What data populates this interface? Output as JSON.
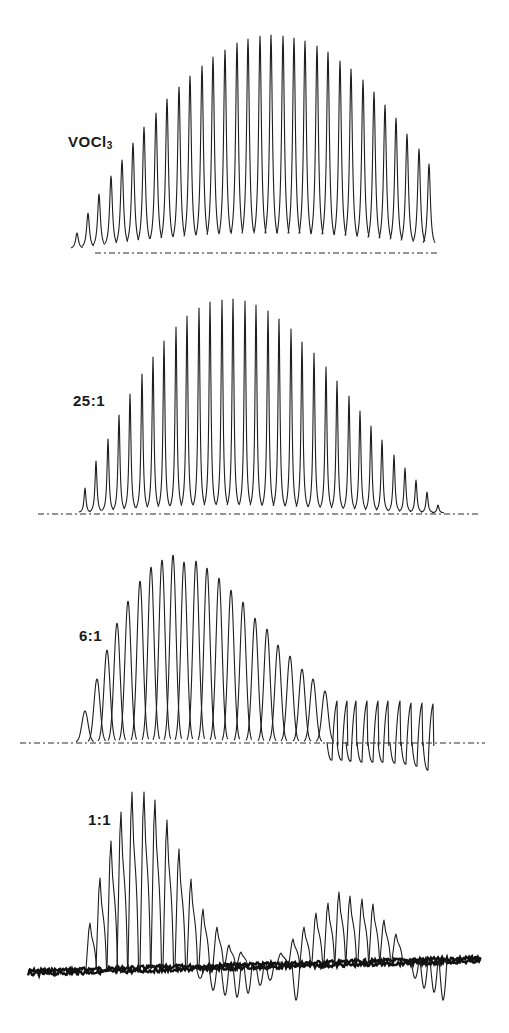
{
  "figure": {
    "panels": [
      {
        "id": "voclc3",
        "label_main": "VOCl",
        "label_sub": "3",
        "label_pos": [
          68,
          134
        ]
      },
      {
        "id": "ratio-25",
        "label_main": "25:1",
        "label_sub": "",
        "label_pos": [
          73,
          393
        ]
      },
      {
        "id": "ratio-6",
        "label_main": "6:1",
        "label_sub": "",
        "label_pos": [
          79,
          628
        ]
      },
      {
        "id": "ratio-1",
        "label_main": "1:1",
        "label_sub": "",
        "label_pos": [
          88,
          812
        ]
      }
    ]
  },
  "chart_data": [
    {
      "type": "line",
      "title": "VOCl3",
      "description": "Stacked series of sharp peaks (spectrum trace), envelope rising then falling",
      "xlabel": "",
      "ylabel": "",
      "grid": false,
      "baseline_y": 249,
      "dashed_baseline": {
        "x0": 95,
        "x1": 440,
        "y": 253
      },
      "peak_width": 4.2,
      "peaks_x": [
        77,
        88,
        99,
        111,
        122,
        133,
        144,
        156,
        167,
        179,
        190,
        202,
        213,
        225,
        237,
        248,
        260,
        271,
        283,
        294,
        305,
        317,
        328,
        340,
        351,
        363,
        374,
        385,
        396,
        407,
        419,
        429
      ],
      "peaks_top_y": [
        233,
        213,
        194,
        176,
        160,
        143,
        127,
        113,
        99,
        87,
        76,
        66,
        57,
        50,
        43,
        39,
        36,
        35,
        36,
        38,
        41,
        46,
        52,
        61,
        69,
        80,
        92,
        105,
        118,
        134,
        149,
        164
      ],
      "relative_heights": [
        0.07,
        0.17,
        0.26,
        0.34,
        0.42,
        0.5,
        0.57,
        0.64,
        0.71,
        0.76,
        0.81,
        0.86,
        0.9,
        0.93,
        0.97,
        0.98,
        1.0,
        1.0,
        1.0,
        0.99,
        0.97,
        0.95,
        0.92,
        0.87,
        0.84,
        0.79,
        0.73,
        0.67,
        0.61,
        0.53,
        0.47,
        0.4
      ]
    },
    {
      "type": "line",
      "title": "25:1",
      "description": "Sharp peaks, envelope peaking toward center then tapering",
      "xlabel": "",
      "ylabel": "",
      "grid": false,
      "baseline_y": 513,
      "dashed_baseline": {
        "x0": 38,
        "x1": 478,
        "y": 514
      },
      "peak_width": 3.6,
      "peaks_x": [
        85,
        96,
        108,
        119,
        130,
        142,
        153,
        164,
        176,
        187,
        199,
        210,
        222,
        233,
        245,
        256,
        268,
        279,
        291,
        302,
        314,
        326,
        337,
        349,
        360,
        371,
        382,
        394,
        405,
        416,
        427,
        438
      ],
      "peaks_top_y": [
        488,
        461,
        439,
        415,
        394,
        374,
        357,
        341,
        327,
        316,
        308,
        302,
        300,
        299,
        301,
        305,
        311,
        319,
        329,
        342,
        353,
        367,
        381,
        396,
        411,
        426,
        440,
        455,
        468,
        480,
        492,
        505
      ],
      "relative_heights": [
        0.12,
        0.24,
        0.34,
        0.46,
        0.56,
        0.65,
        0.73,
        0.8,
        0.87,
        0.92,
        0.95,
        0.98,
        0.99,
        1.0,
        0.99,
        0.97,
        0.95,
        0.91,
        0.86,
        0.8,
        0.75,
        0.68,
        0.62,
        0.55,
        0.48,
        0.41,
        0.34,
        0.27,
        0.21,
        0.15,
        0.1,
        0.04
      ]
    },
    {
      "type": "line",
      "title": "6:1",
      "description": "Broader peaks with maximum near left; right portion shows dispersive (sawtooth) lines going below baseline",
      "xlabel": "",
      "ylabel": "",
      "grid": false,
      "baseline_y": 742,
      "dashed_baseline": {
        "x0": 20,
        "x1": 485,
        "y": 743
      },
      "peak_width": 6.5,
      "peaks_x": [
        85,
        97,
        107,
        117,
        128,
        140,
        151,
        162,
        173,
        184,
        196,
        207,
        219,
        231,
        243,
        255,
        267,
        278,
        290,
        302,
        313,
        325
      ],
      "peaks_top_y": [
        711,
        679,
        650,
        623,
        601,
        581,
        567,
        560,
        555,
        562,
        561,
        568,
        578,
        590,
        602,
        618,
        629,
        645,
        656,
        669,
        679,
        691
      ],
      "dispersive_x": [
        337,
        347,
        356,
        367,
        378,
        388,
        400,
        411,
        422,
        433
      ],
      "dispersive_top_y": [
        701,
        701,
        701,
        701,
        701,
        701,
        701,
        703,
        703,
        704
      ],
      "dispersive_trough_y": [
        760,
        760,
        761,
        762,
        762,
        762,
        763,
        764,
        766,
        770
      ]
    },
    {
      "type": "line",
      "title": "1:1",
      "description": "Noisy trace with two peak groups: strong left group and weaker right group; negative excursions below baseline",
      "xlabel": "",
      "ylabel": "",
      "grid": false,
      "baseline": {
        "x0": 28,
        "y0": 971,
        "x1": 481,
        "y1": 958
      },
      "group1_x": [
        90,
        100,
        111,
        121,
        132,
        144,
        155,
        167,
        179,
        191,
        203,
        217,
        229,
        241
      ],
      "group1_top_y": [
        923,
        878,
        841,
        812,
        792,
        792,
        800,
        820,
        849,
        879,
        909,
        927,
        945,
        952
      ],
      "group2_x": [
        281,
        293,
        304,
        316,
        328,
        339,
        350,
        362,
        373,
        384,
        396
      ],
      "group2_top_y": [
        953,
        939,
        927,
        913,
        903,
        892,
        896,
        899,
        904,
        920,
        934
      ],
      "negative_dips": [
        {
          "x": 200,
          "y": 978
        },
        {
          "x": 213,
          "y": 990
        },
        {
          "x": 225,
          "y": 995
        },
        {
          "x": 237,
          "y": 997
        },
        {
          "x": 248,
          "y": 993
        },
        {
          "x": 260,
          "y": 985
        },
        {
          "x": 270,
          "y": 980
        },
        {
          "x": 296,
          "y": 1000
        },
        {
          "x": 415,
          "y": 978
        },
        {
          "x": 424,
          "y": 988
        },
        {
          "x": 434,
          "y": 992
        },
        {
          "x": 443,
          "y": 1000
        }
      ]
    }
  ]
}
